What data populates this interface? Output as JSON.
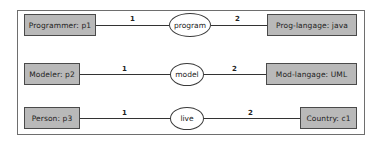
{
  "diagram": {
    "rows": [
      {
        "left": {
          "label": "Programmer: p1"
        },
        "relation": {
          "label": "program"
        },
        "right": {
          "label": "Prog-langage: java"
        },
        "left_multiplicity": "1",
        "right_multiplicity": "2"
      },
      {
        "left": {
          "label": "Modeler: p2"
        },
        "relation": {
          "label": "model"
        },
        "right": {
          "label": "Mod-langage: UML"
        },
        "left_multiplicity": "1",
        "right_multiplicity": "2"
      },
      {
        "left": {
          "label": "Person: p3"
        },
        "relation": {
          "label": "live"
        },
        "right": {
          "label": "Country: c1"
        },
        "left_multiplicity": "1",
        "right_multiplicity": "2"
      }
    ],
    "colors": {
      "box_fill": "#b9b9b9",
      "box_border": "#4a4a4a",
      "frame_border": "#6e6e6e",
      "line": "#333333"
    }
  }
}
